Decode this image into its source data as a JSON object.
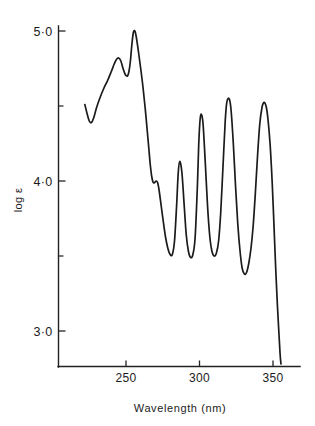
{
  "chart_data": {
    "type": "line",
    "title": "",
    "xlabel": "Wavelength  (nm)",
    "ylabel": "log ε",
    "xlim": [
      218,
      360
    ],
    "ylim": [
      2.72,
      5.12
    ],
    "grid": false,
    "legend": null,
    "x_ticks": [
      {
        "value": 250,
        "label": "250"
      },
      {
        "value": 300,
        "label": "300"
      },
      {
        "value": 350,
        "label": "350"
      }
    ],
    "x_minor_ticks": [],
    "y_ticks": [
      {
        "value": 5.0,
        "label": "5·0"
      },
      {
        "value": 4.0,
        "label": "4·0"
      },
      {
        "value": 3.0,
        "label": "3·0"
      }
    ],
    "y_minor_ticks": [
      4.5,
      3.5
    ],
    "series": [
      {
        "name": "absorption spectrum",
        "color": "#1b1b1b",
        "x": [
          222.0,
          223.5,
          225.0,
          226.5,
          228.0,
          230.0,
          232.5,
          235.0,
          237.5,
          240.0,
          242.0,
          243.5,
          245.0,
          246.5,
          248.0,
          249.5,
          251.0,
          252.0,
          253.0,
          254.0,
          255.0,
          256.0,
          257.0,
          258.5,
          260.0,
          261.5,
          263.0,
          264.5,
          265.5,
          266.5,
          267.5,
          268.5,
          269.5,
          270.5,
          271.5,
          272.5,
          274.0,
          275.5,
          277.0,
          278.5,
          280.0,
          281.5,
          283.0,
          284.5,
          285.5,
          286.5,
          288.0,
          289.5,
          291.0,
          292.5,
          294.0,
          295.5,
          297.0,
          298.5,
          299.5,
          300.5,
          301.5,
          302.5,
          304.0,
          305.5,
          307.0,
          308.5,
          310.0,
          311.5,
          313.0,
          314.5,
          316.0,
          317.5,
          318.5,
          319.5,
          320.5,
          321.5,
          323.0,
          324.5,
          326.0,
          327.5,
          329.0,
          330.5,
          332.0,
          333.5,
          335.0,
          336.5,
          338.0,
          339.5,
          341.0,
          342.5,
          343.5,
          344.5,
          345.5,
          346.5,
          348.0,
          349.5,
          351.0,
          352.0,
          353.0,
          354.0,
          354.8,
          355.4
        ],
        "y": [
          4.51,
          4.45,
          4.4,
          4.39,
          4.42,
          4.49,
          4.56,
          4.62,
          4.67,
          4.73,
          4.78,
          4.81,
          4.82,
          4.8,
          4.75,
          4.71,
          4.7,
          4.73,
          4.8,
          4.91,
          4.99,
          5.0,
          4.96,
          4.86,
          4.75,
          4.63,
          4.49,
          4.33,
          4.22,
          4.11,
          4.03,
          3.99,
          3.99,
          4.0,
          3.99,
          3.94,
          3.83,
          3.72,
          3.62,
          3.55,
          3.51,
          3.51,
          3.6,
          3.85,
          4.05,
          4.13,
          4.06,
          3.85,
          3.64,
          3.53,
          3.49,
          3.51,
          3.62,
          3.95,
          4.25,
          4.42,
          4.44,
          4.37,
          4.11,
          3.83,
          3.63,
          3.53,
          3.5,
          3.52,
          3.6,
          3.8,
          4.1,
          4.4,
          4.52,
          4.55,
          4.54,
          4.47,
          4.25,
          3.97,
          3.72,
          3.54,
          3.42,
          3.38,
          3.39,
          3.45,
          3.55,
          3.7,
          3.92,
          4.17,
          4.38,
          4.49,
          4.52,
          4.52,
          4.49,
          4.42,
          4.25,
          3.98,
          3.62,
          3.38,
          3.17,
          2.99,
          2.85,
          2.78
        ]
      }
    ],
    "annotations": []
  },
  "axis_labels": {
    "y_title": "log ε",
    "x_title": "Wavelength  (nm)",
    "y_tick_5": "5·0",
    "y_tick_4": "4·0",
    "y_tick_3": "3·0",
    "x_tick_250": "250",
    "x_tick_300": "300",
    "x_tick_350": "350"
  },
  "style": {
    "curve_color": "#1b1b1b",
    "axis_color": "#222222",
    "background": "#ffffff"
  }
}
